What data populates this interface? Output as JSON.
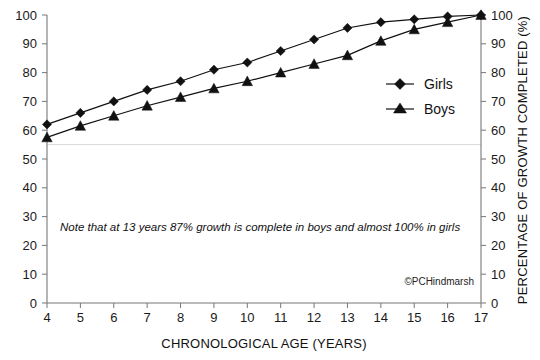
{
  "chart_data": {
    "type": "line",
    "title": "",
    "xlabel": "CHRONOLOGICAL AGE (YEARS)",
    "ylabel": "PERCENTAGE OF GROWTH COMPLETED (%)",
    "xlim": [
      4,
      17
    ],
    "ylim": [
      0,
      100
    ],
    "xticks": [
      "4",
      "5",
      "6",
      "7",
      "8",
      "9",
      "10",
      "11",
      "12",
      "13",
      "14",
      "15",
      "16",
      "17"
    ],
    "yticks": [
      "0",
      "10",
      "20",
      "30",
      "40",
      "50",
      "60",
      "70",
      "80",
      "90",
      "100"
    ],
    "grid": false,
    "gridline_y": 55,
    "legend_position": "center-right",
    "x": [
      4,
      5,
      6,
      7,
      8,
      9,
      10,
      11,
      12,
      13,
      14,
      15,
      16,
      17
    ],
    "series": [
      {
        "name": "Girls",
        "marker": "diamond",
        "values": [
          62,
          66,
          70,
          74,
          77,
          81,
          83.5,
          87.5,
          91.5,
          95.5,
          97.5,
          98.5,
          99.5,
          100
        ]
      },
      {
        "name": "Boys",
        "marker": "triangle",
        "values": [
          57.5,
          61.5,
          65,
          68.5,
          71.5,
          74.5,
          77,
          80,
          83,
          86,
          91,
          95,
          97.5,
          100
        ]
      }
    ],
    "annotations": [
      {
        "id": "growth-note",
        "text": "Note that at 13 years 87% growth is complete in boys and almost 100% in girls"
      },
      {
        "id": "credit",
        "text": "©PCHindmarsh"
      }
    ],
    "colors": {
      "series_line": "#111111",
      "marker": "#111111",
      "axis": "#777777",
      "gridline": "#d8d8d8",
      "background": "#ffffff"
    }
  }
}
